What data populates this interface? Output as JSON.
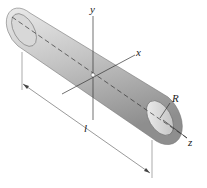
{
  "diagram": {
    "type": "cylinder-axes",
    "labels": {
      "y": "y",
      "x": "x",
      "z": "z",
      "radius": "R",
      "length": "l"
    },
    "colors": {
      "cylinder_light": "#e6e6e6",
      "cylinder_dark": "#9a9a9a",
      "lines": "#333333"
    }
  }
}
